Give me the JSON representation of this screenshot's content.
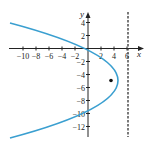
{
  "diagram": {
    "type": "coordinate-plane",
    "axes": {
      "x_label": "x",
      "y_label": "y",
      "x_ticks": [
        "−10",
        "−8",
        "−6",
        "−4",
        "−2",
        "2",
        "4",
        "6"
      ],
      "x_tick_values": [
        -10,
        -8,
        -6,
        -4,
        -2,
        2,
        4,
        6
      ],
      "y_ticks": [
        "4",
        "2",
        "−2",
        "−4",
        "−6",
        "−8",
        "−10",
        "−12"
      ],
      "y_tick_values": [
        4,
        2,
        -2,
        -4,
        -6,
        -8,
        -10,
        -12
      ]
    },
    "curve": {
      "kind": "parabola opening left",
      "vertex": [
        4.5,
        -5
      ],
      "passes_through": [
        [
          0,
          0
        ],
        [
          0,
          -10
        ]
      ],
      "color": "#3a9fd0"
    },
    "focus_point": {
      "x": 3.5,
      "y": -5,
      "color": "#111111"
    },
    "directrix": {
      "x": 6,
      "style": "dashed",
      "color": "#333333"
    }
  }
}
